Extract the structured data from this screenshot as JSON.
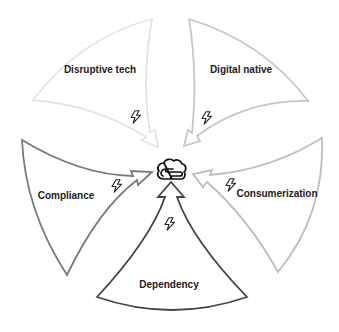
{
  "diagram": {
    "center": {
      "icon": "cloud-icon",
      "x": 171,
      "y": 170
    },
    "segments": [
      {
        "id": "disruptive-tech",
        "label": "Disruptive tech",
        "stroke": "#e4e4e4",
        "label_x": 100,
        "label_y": 69,
        "bolt_x": 136,
        "bolt_y": 117
      },
      {
        "id": "digital-native",
        "label": "Digital native",
        "stroke": "#c6c6c6",
        "label_x": 241,
        "label_y": 69,
        "bolt_x": 207,
        "bolt_y": 118
      },
      {
        "id": "compliance",
        "label": "Compliance",
        "stroke": "#7a7a7a",
        "label_x": 66,
        "label_y": 195,
        "bolt_x": 117,
        "bolt_y": 186
      },
      {
        "id": "consumerization",
        "label": "Consumerization",
        "stroke": "#bdbdbd",
        "label_x": 277,
        "label_y": 193,
        "bolt_x": 231,
        "bolt_y": 185
      },
      {
        "id": "dependency",
        "label": "Dependency",
        "stroke": "#444444",
        "label_x": 169,
        "label_y": 284,
        "bolt_x": 170,
        "bolt_y": 224
      }
    ],
    "icons": {
      "bolt": "lightning-bolt-icon",
      "center": "cloud-icon"
    }
  }
}
